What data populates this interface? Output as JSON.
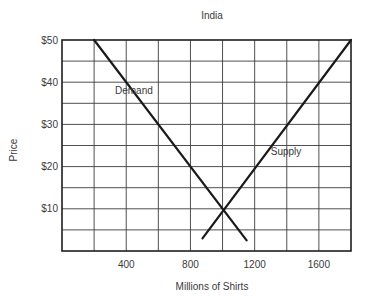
{
  "chart_data": {
    "type": "line",
    "title": "India",
    "xlabel": "Millions of Shirts",
    "ylabel": "Price",
    "xlim": [
      0,
      1800
    ],
    "ylim": [
      0,
      50
    ],
    "x_ticks": [
      400,
      800,
      1200,
      1600
    ],
    "x_tick_labels": [
      "400",
      "800",
      "1200",
      "1600"
    ],
    "y_ticks": [
      10,
      20,
      30,
      40,
      50
    ],
    "y_tick_labels": [
      "$10",
      "$20",
      "$30",
      "$40",
      "$50"
    ],
    "grid": true,
    "grid_x_step": 200,
    "grid_y_step": 5,
    "legend": null,
    "series": [
      {
        "name": "Demand",
        "label_position": {
          "x": 330,
          "y": 38
        },
        "points": [
          {
            "x": 200,
            "y": 50
          },
          {
            "x": 1150,
            "y": 2.5
          }
        ]
      },
      {
        "name": "Supply",
        "label_position": {
          "x": 1300,
          "y": 23.5
        },
        "points": [
          {
            "x": 875,
            "y": 3
          },
          {
            "x": 1800,
            "y": 50
          }
        ]
      }
    ],
    "equilibrium": {
      "x": 1000,
      "y": 10
    }
  }
}
